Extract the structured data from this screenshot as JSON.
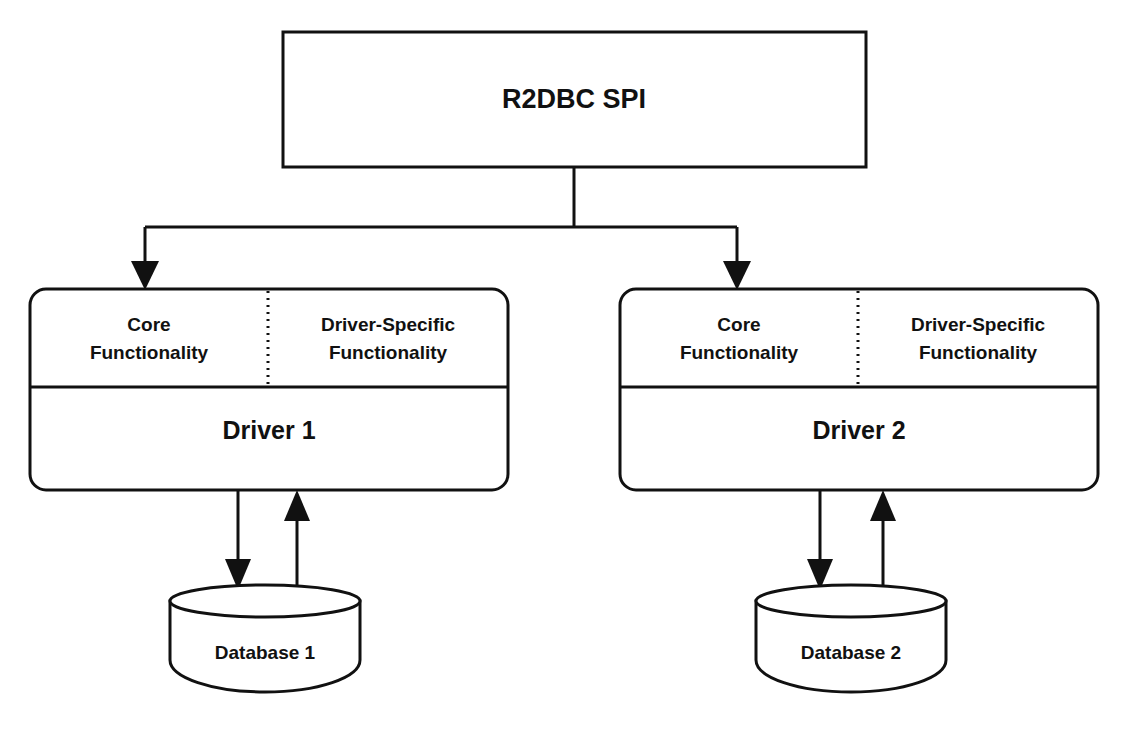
{
  "diagram": {
    "background_color": "#ffffff",
    "stroke_color": "#111111",
    "spi": {
      "label": "R2DBC SPI"
    },
    "drivers": [
      {
        "name": "Driver 1",
        "core_line1": "Core",
        "core_line2": "Functionality",
        "specific_line1": "Driver-Specific",
        "specific_line2": "Functionality"
      },
      {
        "name": "Driver 2",
        "core_line1": "Core",
        "core_line2": "Functionality",
        "specific_line1": "Driver-Specific",
        "specific_line2": "Functionality"
      }
    ],
    "databases": [
      {
        "label": "Database 1"
      },
      {
        "label": "Database 2"
      }
    ],
    "connectors": [
      {
        "from": "R2DBC SPI",
        "to": "Driver 1",
        "direction": "down"
      },
      {
        "from": "R2DBC SPI",
        "to": "Driver 2",
        "direction": "down"
      },
      {
        "from": "Driver 1",
        "to": "Database 1",
        "direction": "down"
      },
      {
        "from": "Database 1",
        "to": "Driver 1",
        "direction": "up"
      },
      {
        "from": "Driver 2",
        "to": "Database 2",
        "direction": "down"
      },
      {
        "from": "Database 2",
        "to": "Driver 2",
        "direction": "up"
      }
    ]
  }
}
